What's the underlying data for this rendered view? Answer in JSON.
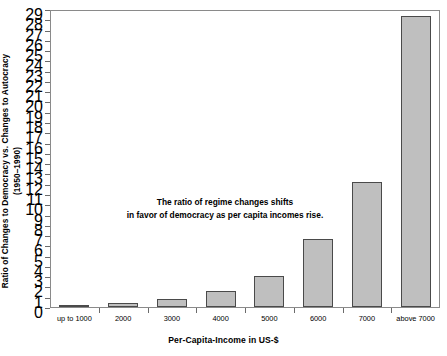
{
  "chart_data": {
    "type": "bar",
    "title": "",
    "xlabel": "Per-Capita-Income in US-$",
    "ylabel": "Ratio of Changes to Democracy vs. Changes to Autocracy",
    "ylabel_line2": "(1950–1990)",
    "categories": [
      "up to 1000",
      "2000",
      "3000",
      "4000",
      "5000",
      "6000",
      "7000",
      "above 7000"
    ],
    "values": [
      0.12,
      0.35,
      0.75,
      1.6,
      3.05,
      6.6,
      12.2,
      28.3
    ],
    "ylim": [
      0,
      29
    ],
    "ytick_labels": [
      "0",
      "1",
      "2",
      "3",
      "4",
      "5",
      "6",
      "7",
      "8",
      "9",
      "10",
      "11",
      "12",
      "13",
      "14",
      "15",
      "16",
      "17",
      "18",
      "19",
      "20",
      "21",
      "22",
      "23",
      "24",
      "25",
      "26",
      "27",
      "28",
      "29"
    ],
    "ytick_values": [
      0,
      1,
      2,
      3,
      4,
      5,
      6,
      7,
      8,
      9,
      10,
      11,
      12,
      13,
      14,
      15,
      16,
      17,
      18,
      19,
      20,
      21,
      22,
      23,
      24,
      25,
      26,
      27,
      28,
      29
    ],
    "grid": false,
    "legend": null,
    "annotations": [
      {
        "line1": "The ratio of regime changes shifts",
        "line2": "in favor of democracy as per capita incomes rise."
      }
    ],
    "colors": {
      "bar_fill": "#bfbfbf",
      "bar_border": "#4a4a4a",
      "axis": "#8a8a8a",
      "text": "#000000",
      "background": "#ffffff"
    }
  }
}
